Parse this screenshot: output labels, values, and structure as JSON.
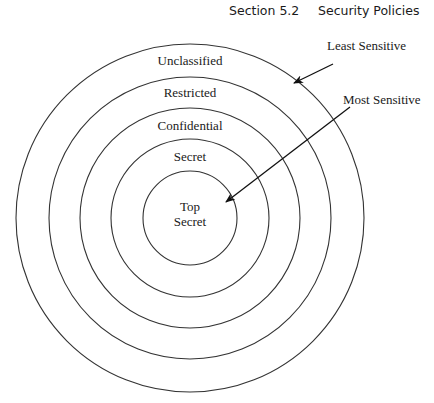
{
  "header": {
    "section": "Section 5.2",
    "title": "Security Policies"
  },
  "diagram": {
    "type": "concentric-circles",
    "center": [
      190,
      218
    ],
    "stroke_color": "#333333",
    "rings": [
      {
        "label": "Unclassified",
        "radius": 174,
        "label_y": 65
      },
      {
        "label": "Restricted",
        "radius": 141,
        "label_y": 97
      },
      {
        "label": "Confidential",
        "radius": 110,
        "label_y": 130
      },
      {
        "label": "Secret",
        "radius": 79,
        "label_y": 161
      },
      {
        "label_lines": [
          "Top",
          "Secret"
        ],
        "radius": 47,
        "label_y": 211
      }
    ],
    "annotations": [
      {
        "label": "Least Sensitive",
        "text_x": 336,
        "text_y": 50,
        "arrow_from": [
          333,
          64
        ],
        "arrow_to": [
          294,
          83
        ]
      },
      {
        "label": "Most Sensitive",
        "text_x": 343,
        "text_y": 104,
        "arrow_from": [
          350,
          107
        ],
        "arrow_to": [
          226,
          202
        ]
      }
    ]
  }
}
